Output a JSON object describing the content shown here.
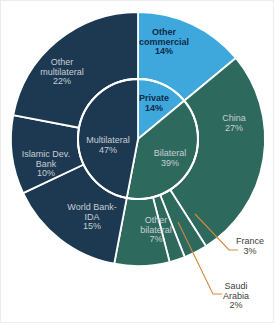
{
  "chart_data": {
    "type": "pie",
    "subtype": "nested-donut",
    "unit": "percent",
    "title": "",
    "direction": "clockwise",
    "start_angle_deg": 0,
    "legend_position": "none",
    "rings": {
      "inner": {
        "name": "creditor-type",
        "segments": [
          {
            "id": "private",
            "label": "Private",
            "label_lines": [
              "Private"
            ],
            "value": 14,
            "color": "#3EA8DC"
          },
          {
            "id": "bilateral",
            "label": "Bilateral",
            "label_lines": [
              "Bilateral"
            ],
            "value": 39,
            "color": "#2E695E"
          },
          {
            "id": "multilateral",
            "label": "Multilateral",
            "label_lines": [
              "Multilateral"
            ],
            "value": 47,
            "color": "#1C3951"
          }
        ]
      },
      "outer": {
        "name": "creditor",
        "segments": [
          {
            "id": "other_commercial",
            "label": "Other commercial",
            "label_lines": [
              "Other",
              "commercial"
            ],
            "value": 14,
            "color": "#3EA8DC",
            "external": false
          },
          {
            "id": "china",
            "label": "China",
            "label_lines": [
              "China"
            ],
            "value": 27,
            "color": "#2E695E",
            "external": false
          },
          {
            "id": "france",
            "label": "France",
            "label_lines": [
              "France"
            ],
            "value": 3,
            "color": "#2E695E",
            "external": true
          },
          {
            "id": "saudi_arabia",
            "label": "Saudi Arabia",
            "label_lines": [
              "Saudi",
              "Arabia"
            ],
            "value": 2,
            "color": "#2E695E",
            "external": true
          },
          {
            "id": "other_bilateral",
            "label": "Other bilateral",
            "label_lines": [
              "Other",
              "bilateral"
            ],
            "value": 7,
            "color": "#2E695E",
            "external": false
          },
          {
            "id": "world_bank_ida",
            "label": "World Bank-IDA",
            "label_lines": [
              "World Bank-",
              "IDA"
            ],
            "value": 15,
            "color": "#1C3951",
            "external": false
          },
          {
            "id": "islamic_dev_bank",
            "label": "Islamic Dev. Bank",
            "label_lines": [
              "Islamic Dev.",
              "Bank"
            ],
            "value": 10,
            "color": "#1C3951",
            "external": false
          },
          {
            "id": "other_multilateral",
            "label": "Other multilateral",
            "label_lines": [
              "Other",
              "multilateral"
            ],
            "value": 22,
            "color": "#1C3951",
            "external": false
          }
        ]
      }
    },
    "colors": {
      "commercial_blue": "#3EA8DC",
      "bilateral_green": "#2E695E",
      "multilateral_navy": "#1C3951",
      "leader_line": "#D6873D",
      "label_light": "#C6CED4",
      "label_dark": "#10294A",
      "label_external": "#3D3D3D",
      "background": "#FFFFFF"
    }
  }
}
